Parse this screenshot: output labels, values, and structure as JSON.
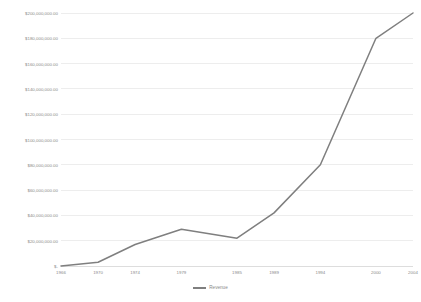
{
  "chart_data": {
    "type": "line",
    "title": "",
    "subtitle": "",
    "xlabel": "",
    "ylabel": "",
    "x": [
      1966,
      1970,
      1974,
      1979,
      1985,
      1989,
      1994,
      2000,
      2004
    ],
    "categories": [
      "1966",
      "1970",
      "1974",
      "1979",
      "1985",
      "1989",
      "1994",
      "2000",
      "2004"
    ],
    "series": [
      {
        "name": "Revenue",
        "color": "#7f7f7f",
        "values": [
          0,
          3000000,
          17000000,
          29000000,
          22000000,
          42000000,
          80000000,
          180000000,
          200000000
        ]
      }
    ],
    "ylim": [
      0,
      200000000
    ],
    "ytick_values": [
      0,
      20000000,
      40000000,
      60000000,
      80000000,
      100000000,
      120000000,
      140000000,
      160000000,
      180000000,
      200000000
    ],
    "ytick_labels": [
      "$-",
      "$20,000,000.00",
      "$40,000,000.00",
      "$60,000,000.00",
      "$80,000,000.00",
      "$100,000,000.00",
      "$120,000,000.00",
      "$140,000,000.00",
      "$160,000,000.00",
      "$180,000,000.00",
      "$200,000,000.00"
    ],
    "grid": true,
    "grid_axis": "y",
    "grid_color": "#e8e8e8",
    "legend": true,
    "legend_position": "bottom",
    "legend_entries": [
      "Revenue"
    ],
    "background_color": "#ffffff",
    "axis_label_color": "#8a8a8a"
  }
}
